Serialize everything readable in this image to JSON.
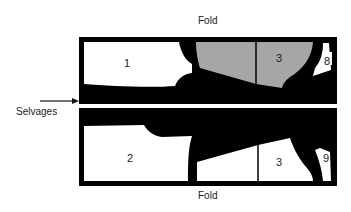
{
  "diagram": {
    "type": "fabric-layout / pattern marker",
    "labels": {
      "fold_top": "Fold",
      "fold_bottom": "Fold",
      "selvages": "Selvages"
    },
    "upper_panel": {
      "pieces": [
        {
          "id": "1",
          "label": "1",
          "fill": "#ffffff"
        },
        {
          "id": "3-upper",
          "label": "3",
          "fill": "#a6a6a6"
        },
        {
          "id": "8",
          "label": "8",
          "fill": "#ffffff"
        }
      ]
    },
    "lower_panel": {
      "pieces": [
        {
          "id": "2",
          "label": "2",
          "fill": "#ffffff"
        },
        {
          "id": "3-lower",
          "label": "3",
          "fill": "#ffffff"
        },
        {
          "id": "9",
          "label": "9",
          "fill": "#ffffff"
        }
      ]
    },
    "colors": {
      "fabric": "#000000",
      "highlight_piece": "#a6a6a6",
      "piece": "#ffffff",
      "text": "#222222"
    }
  }
}
